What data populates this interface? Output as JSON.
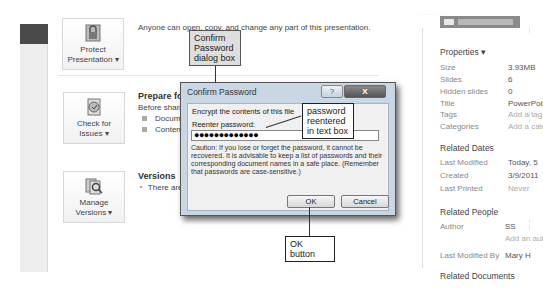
{
  "backstage": {
    "protect": {
      "button_label_line1": "Protect",
      "button_label_line2": "Presentation ▾",
      "description": "Anyone can open, copy, and change any part of this presentation."
    },
    "prepare": {
      "button_label_line1": "Check for",
      "button_label_line2": "Issues ▾",
      "title": "Prepare for Sharing",
      "description": "Before sharing this file, be aware that it contains:",
      "bullets": [
        "Document properties and author's name",
        "Content that people with disabilities find difficult to read"
      ]
    },
    "versions": {
      "button_label_line1": "Manage",
      "button_label_line2": "Versions ▾",
      "title": "Versions",
      "description": "There are no previous versions of this file."
    }
  },
  "properties": {
    "header": "Properties ▾",
    "rows": [
      {
        "label": "Size",
        "value": "3.93MB",
        "muted": false
      },
      {
        "label": "Slides",
        "value": "6",
        "muted": false
      },
      {
        "label": "Hidden slides",
        "value": "0",
        "muted": false
      },
      {
        "label": "Title",
        "value": "PowerPoint",
        "muted": false
      },
      {
        "label": "Tags",
        "value": "Add a tag",
        "muted": true
      },
      {
        "label": "Categories",
        "value": "Add a category",
        "muted": true
      }
    ],
    "related_dates": {
      "header": "Related Dates",
      "rows": [
        {
          "label": "Last Modified",
          "value": "Today, 5"
        },
        {
          "label": "Created",
          "value": "3/9/2011"
        },
        {
          "label": "Last Printed",
          "value": "Never"
        }
      ]
    },
    "related_people": {
      "header": "Related People",
      "author_label": "Author",
      "author_value": "SS",
      "add_author": "Add an author",
      "last_modified_by_label": "Last Modified By",
      "last_modified_by_value": "Mary H"
    },
    "related_documents_header": "Related Documents"
  },
  "dialog": {
    "title": "Confirm Password",
    "help_glyph": "?",
    "close_glyph": "X",
    "heading": "Encrypt the contents of this file",
    "reenter_label": "Reenter password:",
    "password_value": "●●●●●●●●●●●●●",
    "caution": "Caution: If you lose or forget the password, it cannot be recovered. It is advisable to keep a list of passwords and their corresponding document names in a safe place. (Remember that passwords are case-sensitive.)",
    "ok_label": "OK",
    "cancel_label": "Cancel"
  },
  "callouts": {
    "dialog_box": "Confirm Password dialog box",
    "password": "password reentered in text box",
    "ok_button": "OK button"
  }
}
